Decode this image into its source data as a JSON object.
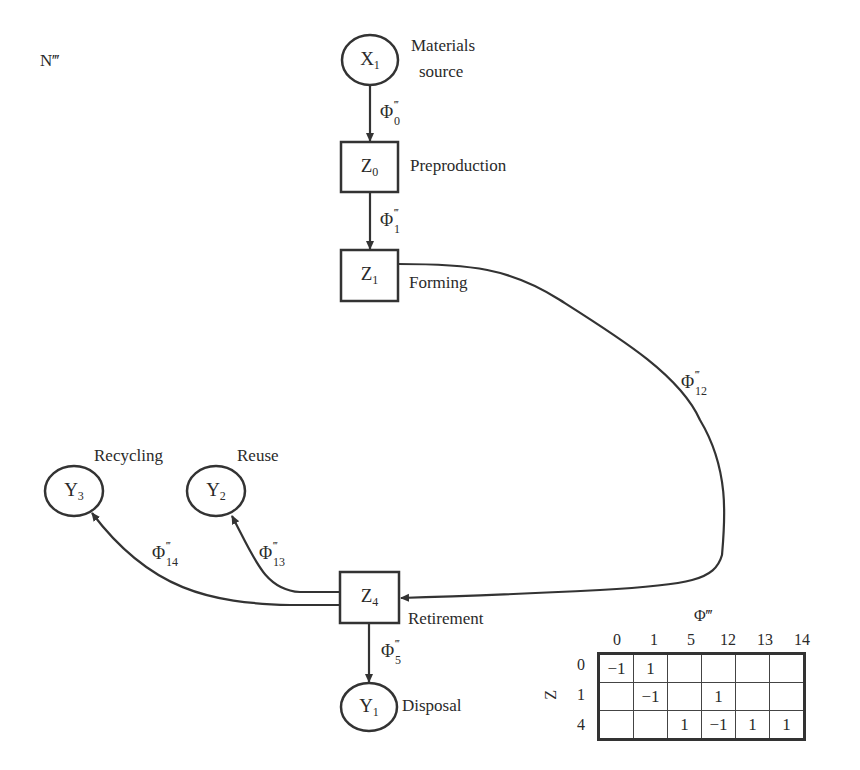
{
  "diagram": {
    "network_label": "N‴",
    "nodes": {
      "x1": {
        "symbol": "X",
        "index": "1",
        "label_line1": "Materials",
        "label_line2": "source"
      },
      "z0": {
        "symbol": "Z",
        "index": "0",
        "label": "Preproduction"
      },
      "z1": {
        "symbol": "Z",
        "index": "1",
        "label": "Forming"
      },
      "z4": {
        "symbol": "Z",
        "index": "4",
        "label": "Retirement"
      },
      "y1": {
        "symbol": "Y",
        "index": "1",
        "label": "Disposal"
      },
      "y2": {
        "symbol": "Y",
        "index": "2",
        "label": "Reuse"
      },
      "y3": {
        "symbol": "Y",
        "index": "3",
        "label": "Recycling"
      }
    },
    "flows": {
      "phi0": {
        "symbol": "Φ",
        "prime": "‴",
        "index": "0"
      },
      "phi1": {
        "symbol": "Φ",
        "prime": "‴",
        "index": "1"
      },
      "phi5": {
        "symbol": "Φ",
        "prime": "‴",
        "index": "5"
      },
      "phi12": {
        "symbol": "Φ",
        "prime": "‴",
        "index": "12"
      },
      "phi13": {
        "symbol": "Φ",
        "prime": "‴",
        "index": "13"
      },
      "phi14": {
        "symbol": "Φ",
        "prime": "‴",
        "index": "14"
      }
    },
    "matrix": {
      "title": "Φ‴",
      "row_axis_label": "Z",
      "columns": [
        "0",
        "1",
        "5",
        "12",
        "13",
        "14"
      ],
      "rows": [
        {
          "label": "0",
          "cells": [
            "−1",
            "1",
            "",
            "",
            "",
            ""
          ]
        },
        {
          "label": "1",
          "cells": [
            "",
            "−1",
            "",
            "1",
            "",
            ""
          ]
        },
        {
          "label": "4",
          "cells": [
            "",
            "",
            "1",
            "−1",
            "1",
            "1"
          ]
        }
      ]
    }
  }
}
